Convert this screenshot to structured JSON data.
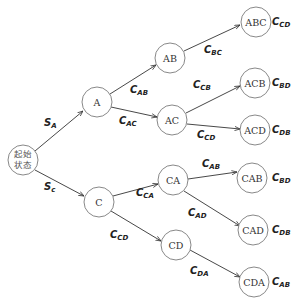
{
  "diagram": {
    "type": "decision-tree",
    "start": {
      "label_line1": "起始",
      "label_line2": "状态"
    },
    "nodes": {
      "A": "A",
      "C": "C",
      "AB": "AB",
      "AC": "AC",
      "CA": "CA",
      "CD": "CD",
      "ABC": "ABC",
      "ACB": "ACB",
      "ACD": "ACD",
      "CAB": "CAB",
      "CAD": "CAD",
      "CDA": "CDA"
    },
    "edges": {
      "start_A": {
        "main": "S",
        "sub": "A"
      },
      "start_C": {
        "main": "S",
        "sub": "c"
      },
      "A_AB": {
        "main": "C",
        "sub": "AB"
      },
      "A_AC": {
        "main": "C",
        "sub": "AC"
      },
      "AB_ABC": {
        "main": "C",
        "sub": "BC"
      },
      "AC_ACB": {
        "main": "C",
        "sub": "CB"
      },
      "AC_ACD": {
        "main": "C",
        "sub": "CD"
      },
      "C_CA": {
        "main": "C",
        "sub": "CA"
      },
      "C_CD": {
        "main": "C",
        "sub": "CD"
      },
      "CA_CAB": {
        "main": "C",
        "sub": "AB"
      },
      "CA_CAD": {
        "main": "C",
        "sub": "AD"
      },
      "CD_CDA": {
        "main": "C",
        "sub": "DA"
      }
    },
    "terminal_costs": {
      "ABC": {
        "main": "C",
        "sub": "CD"
      },
      "ACB": {
        "main": "C",
        "sub": "BD"
      },
      "ACD": {
        "main": "C",
        "sub": "DB"
      },
      "CAB": {
        "main": "C",
        "sub": "BD"
      },
      "CAD": {
        "main": "C",
        "sub": "DB"
      },
      "CDA": {
        "main": "C",
        "sub": "AB"
      }
    }
  }
}
